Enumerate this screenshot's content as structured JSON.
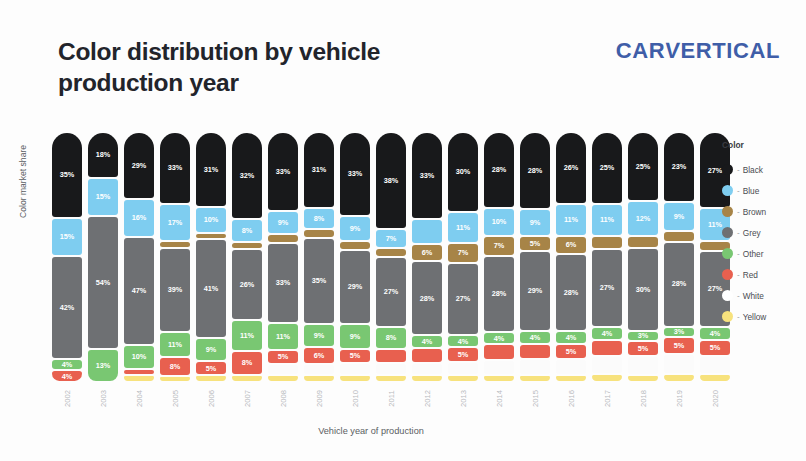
{
  "header": {
    "title": "Color distribution by vehicle production year",
    "logo": "CARVERTICAL",
    "logo_part_1": "CAR",
    "logo_part_2": "V",
    "logo_part_3": "ERTICAL",
    "logo_color": "#3f5ea8"
  },
  "legend": {
    "title": "Color",
    "separator": "-",
    "items": [
      {
        "label": "Black",
        "color": "#18191b",
        "key": "black"
      },
      {
        "label": "Blue",
        "color": "#7ecdf0",
        "key": "blue"
      },
      {
        "label": "Brown",
        "color": "#a78447",
        "key": "brown"
      },
      {
        "label": "Grey",
        "color": "#6e7073",
        "key": "grey"
      },
      {
        "label": "Other",
        "color": "#79c772",
        "key": "other"
      },
      {
        "label": "Red",
        "color": "#e8604f",
        "key": "red"
      },
      {
        "label": "White",
        "color": "#ffffff",
        "key": "white"
      },
      {
        "label": "Yellow",
        "color": "#f7e27d",
        "key": "yellow"
      }
    ]
  },
  "chart_data": {
    "type": "bar",
    "stacked": true,
    "title": "Color distribution by vehicle production year",
    "xlabel": "Vehicle year of production",
    "ylabel": "Color market share",
    "ylim": [
      0,
      100
    ],
    "grid": false,
    "legend_position": "right",
    "categories": [
      "2002",
      "2003",
      "2004",
      "2005",
      "2006",
      "2007",
      "2008",
      "2009",
      "2010",
      "2011",
      "2012",
      "2013",
      "2014",
      "2015",
      "2016",
      "2017",
      "2018",
      "2019",
      "2020"
    ],
    "series": [
      {
        "name": "Black",
        "color": "#18191b",
        "values": [
          35,
          18,
          29,
          33,
          31,
          32,
          33,
          31,
          33,
          38,
          33,
          30,
          28,
          28,
          26,
          25,
          25,
          23,
          27
        ]
      },
      {
        "name": "Blue",
        "color": "#7ecdf0",
        "values": [
          15,
          15,
          16,
          17,
          10,
          8,
          9,
          8,
          9,
          7,
          9,
          11,
          10,
          9,
          11,
          11,
          12,
          9,
          11
        ]
      },
      {
        "name": "Brown",
        "color": "#a78447",
        "values": [
          0,
          0,
          0,
          2,
          2,
          2,
          3,
          3,
          3,
          3,
          6,
          7,
          7,
          5,
          6,
          4,
          4,
          3,
          3
        ]
      },
      {
        "name": "Grey",
        "color": "#6e7073",
        "values": [
          42,
          54,
          47,
          39,
          41,
          26,
          33,
          35,
          29,
          27,
          28,
          27,
          28,
          29,
          28,
          27,
          30,
          28,
          27
        ]
      },
      {
        "name": "Other",
        "color": "#79c772",
        "values": [
          4,
          13,
          10,
          11,
          9,
          11,
          11,
          9,
          9,
          8,
          4,
          4,
          4,
          4,
          4,
          4,
          3,
          3,
          4
        ]
      },
      {
        "name": "Red",
        "color": "#e8604f",
        "values": [
          4,
          0,
          2,
          8,
          5,
          8,
          5,
          6,
          5,
          5,
          5,
          5,
          5,
          5,
          5,
          5,
          5,
          5,
          5
        ]
      },
      {
        "name": "White",
        "color": "#ffffff",
        "values": [
          0,
          0,
          0,
          0,
          0,
          0,
          4,
          4,
          4,
          4,
          4,
          4,
          5,
          5,
          5,
          6,
          6,
          6,
          6
        ]
      },
      {
        "name": "Yellow",
        "color": "#f7e27d",
        "values": [
          0,
          0,
          2,
          2,
          2,
          2,
          2,
          2,
          2,
          2,
          2,
          2,
          2,
          2,
          2,
          2,
          2,
          2,
          2
        ]
      }
    ]
  },
  "bars": [
    {
      "year": "2002",
      "segments": [
        {
          "key": "black",
          "label": "35%",
          "pct": 35
        },
        {
          "key": "blue",
          "label": "15%",
          "pct": 15
        },
        {
          "key": "grey",
          "label": "42%",
          "pct": 42
        },
        {
          "key": "other",
          "label": "4%",
          "pct": 4
        },
        {
          "key": "red",
          "label": "4%",
          "pct": 4
        }
      ]
    },
    {
      "year": "2003",
      "segments": [
        {
          "key": "black",
          "label": "18%",
          "pct": 18
        },
        {
          "key": "blue",
          "label": "15%",
          "pct": 15
        },
        {
          "key": "grey",
          "label": "54%",
          "pct": 54
        },
        {
          "key": "other",
          "label": "13%",
          "pct": 13
        }
      ]
    },
    {
      "year": "2004",
      "segments": [
        {
          "key": "black",
          "label": "29%",
          "pct": 29
        },
        {
          "key": "blue",
          "label": "16%",
          "pct": 16
        },
        {
          "key": "grey",
          "label": "47%",
          "pct": 47
        },
        {
          "key": "other",
          "label": "10%",
          "pct": 10
        },
        {
          "key": "red",
          "label": "",
          "pct": 2
        },
        {
          "key": "yellow",
          "label": "",
          "pct": 2
        }
      ]
    },
    {
      "year": "2005",
      "segments": [
        {
          "key": "black",
          "label": "33%",
          "pct": 33
        },
        {
          "key": "blue",
          "label": "17%",
          "pct": 17
        },
        {
          "key": "brown",
          "label": "",
          "pct": 2
        },
        {
          "key": "grey",
          "label": "39%",
          "pct": 39
        },
        {
          "key": "other",
          "label": "11%",
          "pct": 11
        },
        {
          "key": "red",
          "label": "8%",
          "pct": 8
        },
        {
          "key": "yellow",
          "label": "",
          "pct": 2
        }
      ]
    },
    {
      "year": "2006",
      "segments": [
        {
          "key": "black",
          "label": "31%",
          "pct": 31
        },
        {
          "key": "blue",
          "label": "10%",
          "pct": 10
        },
        {
          "key": "brown",
          "label": "",
          "pct": 2
        },
        {
          "key": "grey",
          "label": "41%",
          "pct": 41
        },
        {
          "key": "other",
          "label": "9%",
          "pct": 9
        },
        {
          "key": "red",
          "label": "5%",
          "pct": 5
        },
        {
          "key": "yellow",
          "label": "",
          "pct": 2
        }
      ]
    },
    {
      "year": "2007",
      "segments": [
        {
          "key": "black",
          "label": "32%",
          "pct": 32
        },
        {
          "key": "blue",
          "label": "8%",
          "pct": 8
        },
        {
          "key": "brown",
          "label": "",
          "pct": 2
        },
        {
          "key": "grey",
          "label": "26%",
          "pct": 26
        },
        {
          "key": "other",
          "label": "11%",
          "pct": 11
        },
        {
          "key": "red",
          "label": "8%",
          "pct": 8
        },
        {
          "key": "yellow",
          "label": "",
          "pct": 2
        }
      ]
    },
    {
      "year": "2008",
      "segments": [
        {
          "key": "black",
          "label": "33%",
          "pct": 33
        },
        {
          "key": "blue",
          "label": "9%",
          "pct": 9
        },
        {
          "key": "brown",
          "label": "",
          "pct": 3
        },
        {
          "key": "grey",
          "label": "33%",
          "pct": 33
        },
        {
          "key": "other",
          "label": "11%",
          "pct": 11
        },
        {
          "key": "red",
          "label": "5%",
          "pct": 5
        },
        {
          "key": "white",
          "label": "",
          "pct": 4
        },
        {
          "key": "yellow",
          "label": "",
          "pct": 2
        }
      ]
    },
    {
      "year": "2009",
      "segments": [
        {
          "key": "black",
          "label": "31%",
          "pct": 31
        },
        {
          "key": "blue",
          "label": "8%",
          "pct": 8
        },
        {
          "key": "brown",
          "label": "",
          "pct": 3
        },
        {
          "key": "grey",
          "label": "35%",
          "pct": 35
        },
        {
          "key": "other",
          "label": "9%",
          "pct": 9
        },
        {
          "key": "red",
          "label": "6%",
          "pct": 6
        },
        {
          "key": "white",
          "label": "",
          "pct": 4
        },
        {
          "key": "yellow",
          "label": "",
          "pct": 2
        }
      ]
    },
    {
      "year": "2010",
      "segments": [
        {
          "key": "black",
          "label": "33%",
          "pct": 33
        },
        {
          "key": "blue",
          "label": "9%",
          "pct": 9
        },
        {
          "key": "brown",
          "label": "",
          "pct": 3
        },
        {
          "key": "grey",
          "label": "29%",
          "pct": 29
        },
        {
          "key": "other",
          "label": "9%",
          "pct": 9
        },
        {
          "key": "red",
          "label": "5%",
          "pct": 5
        },
        {
          "key": "white",
          "label": "",
          "pct": 4
        },
        {
          "key": "yellow",
          "label": "",
          "pct": 2
        }
      ]
    },
    {
      "year": "2011",
      "segments": [
        {
          "key": "black",
          "label": "38%",
          "pct": 38
        },
        {
          "key": "blue",
          "label": "7%",
          "pct": 7
        },
        {
          "key": "brown",
          "label": "",
          "pct": 3
        },
        {
          "key": "grey",
          "label": "27%",
          "pct": 27
        },
        {
          "key": "other",
          "label": "8%",
          "pct": 8
        },
        {
          "key": "red",
          "label": "",
          "pct": 5
        },
        {
          "key": "white",
          "label": "",
          "pct": 4
        },
        {
          "key": "yellow",
          "label": "",
          "pct": 2
        }
      ]
    },
    {
      "year": "2012",
      "segments": [
        {
          "key": "black",
          "label": "33%",
          "pct": 33
        },
        {
          "key": "blue",
          "label": "",
          "pct": 9
        },
        {
          "key": "brown",
          "label": "6%",
          "pct": 6
        },
        {
          "key": "grey",
          "label": "28%",
          "pct": 28
        },
        {
          "key": "other",
          "label": "4%",
          "pct": 4
        },
        {
          "key": "red",
          "label": "",
          "pct": 5
        },
        {
          "key": "white",
          "label": "",
          "pct": 4
        },
        {
          "key": "yellow",
          "label": "",
          "pct": 2
        }
      ]
    },
    {
      "year": "2013",
      "segments": [
        {
          "key": "black",
          "label": "30%",
          "pct": 30
        },
        {
          "key": "blue",
          "label": "11%",
          "pct": 11
        },
        {
          "key": "brown",
          "label": "7%",
          "pct": 7
        },
        {
          "key": "grey",
          "label": "27%",
          "pct": 27
        },
        {
          "key": "other",
          "label": "4%",
          "pct": 4
        },
        {
          "key": "red",
          "label": "5%",
          "pct": 5
        },
        {
          "key": "white",
          "label": "",
          "pct": 4
        },
        {
          "key": "yellow",
          "label": "",
          "pct": 2
        }
      ]
    },
    {
      "year": "2014",
      "segments": [
        {
          "key": "black",
          "label": "28%",
          "pct": 28
        },
        {
          "key": "blue",
          "label": "10%",
          "pct": 10
        },
        {
          "key": "brown",
          "label": "7%",
          "pct": 7
        },
        {
          "key": "grey",
          "label": "28%",
          "pct": 28
        },
        {
          "key": "other",
          "label": "4%",
          "pct": 4
        },
        {
          "key": "red",
          "label": "",
          "pct": 5
        },
        {
          "key": "white",
          "label": "",
          "pct": 5
        },
        {
          "key": "yellow",
          "label": "",
          "pct": 2
        }
      ]
    },
    {
      "year": "2015",
      "segments": [
        {
          "key": "black",
          "label": "28%",
          "pct": 28
        },
        {
          "key": "blue",
          "label": "9%",
          "pct": 9
        },
        {
          "key": "brown",
          "label": "5%",
          "pct": 5
        },
        {
          "key": "grey",
          "label": "29%",
          "pct": 29
        },
        {
          "key": "other",
          "label": "4%",
          "pct": 4
        },
        {
          "key": "red",
          "label": "",
          "pct": 5
        },
        {
          "key": "white",
          "label": "",
          "pct": 5
        },
        {
          "key": "yellow",
          "label": "",
          "pct": 2
        }
      ]
    },
    {
      "year": "2016",
      "segments": [
        {
          "key": "black",
          "label": "26%",
          "pct": 26
        },
        {
          "key": "blue",
          "label": "11%",
          "pct": 11
        },
        {
          "key": "brown",
          "label": "6%",
          "pct": 6
        },
        {
          "key": "grey",
          "label": "28%",
          "pct": 28
        },
        {
          "key": "other",
          "label": "4%",
          "pct": 4
        },
        {
          "key": "red",
          "label": "5%",
          "pct": 5
        },
        {
          "key": "white",
          "label": "",
          "pct": 5
        },
        {
          "key": "yellow",
          "label": "",
          "pct": 2
        }
      ]
    },
    {
      "year": "2017",
      "segments": [
        {
          "key": "black",
          "label": "25%",
          "pct": 25
        },
        {
          "key": "blue",
          "label": "11%",
          "pct": 11
        },
        {
          "key": "brown",
          "label": "",
          "pct": 4
        },
        {
          "key": "grey",
          "label": "27%",
          "pct": 27
        },
        {
          "key": "other",
          "label": "4%",
          "pct": 4
        },
        {
          "key": "red",
          "label": "",
          "pct": 5
        },
        {
          "key": "white",
          "label": "",
          "pct": 6
        },
        {
          "key": "yellow",
          "label": "",
          "pct": 2
        }
      ]
    },
    {
      "year": "2018",
      "segments": [
        {
          "key": "black",
          "label": "25%",
          "pct": 25
        },
        {
          "key": "blue",
          "label": "12%",
          "pct": 12
        },
        {
          "key": "brown",
          "label": "",
          "pct": 4
        },
        {
          "key": "grey",
          "label": "30%",
          "pct": 30
        },
        {
          "key": "other",
          "label": "3%",
          "pct": 3
        },
        {
          "key": "red",
          "label": "5%",
          "pct": 5
        },
        {
          "key": "white",
          "label": "",
          "pct": 6
        },
        {
          "key": "yellow",
          "label": "",
          "pct": 2
        }
      ]
    },
    {
      "year": "2019",
      "segments": [
        {
          "key": "black",
          "label": "23%",
          "pct": 23
        },
        {
          "key": "blue",
          "label": "9%",
          "pct": 9
        },
        {
          "key": "brown",
          "label": "",
          "pct": 3
        },
        {
          "key": "grey",
          "label": "28%",
          "pct": 28
        },
        {
          "key": "other",
          "label": "3%",
          "pct": 3
        },
        {
          "key": "red",
          "label": "5%",
          "pct": 5
        },
        {
          "key": "white",
          "label": "",
          "pct": 6
        },
        {
          "key": "yellow",
          "label": "",
          "pct": 2
        }
      ]
    },
    {
      "year": "2020",
      "segments": [
        {
          "key": "black",
          "label": "27%",
          "pct": 27
        },
        {
          "key": "blue",
          "label": "11%",
          "pct": 11
        },
        {
          "key": "brown",
          "label": "",
          "pct": 3
        },
        {
          "key": "grey",
          "label": "27%",
          "pct": 27
        },
        {
          "key": "other",
          "label": "4%",
          "pct": 4
        },
        {
          "key": "red",
          "label": "5%",
          "pct": 5
        },
        {
          "key": "white",
          "label": "",
          "pct": 6
        },
        {
          "key": "yellow",
          "label": "",
          "pct": 2
        }
      ]
    }
  ]
}
